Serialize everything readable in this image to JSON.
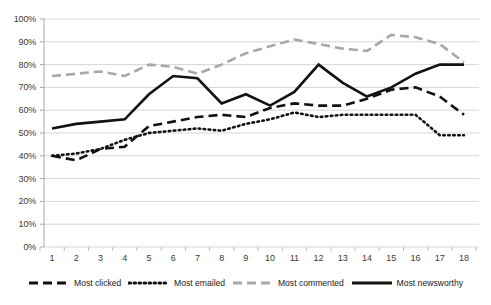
{
  "chart_data": {
    "type": "line",
    "title": "",
    "subtitle": "",
    "xlabel": "",
    "ylabel": "",
    "xlim": [
      1,
      18
    ],
    "ylim": [
      0,
      100
    ],
    "grid": true,
    "legend_position": "bottom",
    "categories": [
      "1",
      "2",
      "3",
      "4",
      "5",
      "6",
      "7",
      "8",
      "9",
      "10",
      "11",
      "12",
      "13",
      "14",
      "15",
      "16",
      "17",
      "18"
    ],
    "x": [
      1,
      2,
      3,
      4,
      5,
      6,
      7,
      8,
      9,
      10,
      11,
      12,
      13,
      14,
      15,
      16,
      17,
      18
    ],
    "ytick_labels": [
      "0%",
      "10%",
      "20%",
      "30%",
      "40%",
      "50%",
      "60%",
      "70%",
      "80%",
      "90%",
      "100%"
    ],
    "ytick_values": [
      0,
      10,
      20,
      30,
      40,
      50,
      60,
      70,
      80,
      90,
      100
    ],
    "series": [
      {
        "name": "Most clicked",
        "style": "dashed",
        "color": "#121212",
        "values": [
          40,
          38,
          43,
          44,
          53,
          55,
          57,
          58,
          57,
          61,
          63,
          62,
          62,
          65,
          69,
          70,
          66,
          58
        ]
      },
      {
        "name": "Most emailed",
        "style": "dotted",
        "color": "#121212",
        "values": [
          40,
          41,
          43,
          47,
          50,
          51,
          52,
          51,
          54,
          56,
          59,
          57,
          58,
          58,
          58,
          58,
          49,
          49
        ]
      },
      {
        "name": "Most commented",
        "style": "dashed",
        "color": "#a8a8a8",
        "values": [
          75,
          76,
          77,
          75,
          80,
          79,
          76,
          80,
          85,
          88,
          91,
          89,
          87,
          86,
          93,
          92,
          89,
          81
        ]
      },
      {
        "name": "Most newsworthy",
        "style": "solid",
        "color": "#121212",
        "values": [
          52,
          54,
          55,
          56,
          67,
          75,
          74,
          63,
          67,
          62,
          68,
          80,
          72,
          66,
          70,
          76,
          80,
          80
        ]
      }
    ]
  },
  "legend": {
    "items": [
      {
        "label": "Most clicked",
        "icon": "dashed-line-icon"
      },
      {
        "label": "Most emailed",
        "icon": "dotted-line-icon"
      },
      {
        "label": "Most commented",
        "icon": "dashed-gray-line-icon"
      },
      {
        "label": "Most newsworthy",
        "icon": "solid-line-icon"
      }
    ]
  }
}
